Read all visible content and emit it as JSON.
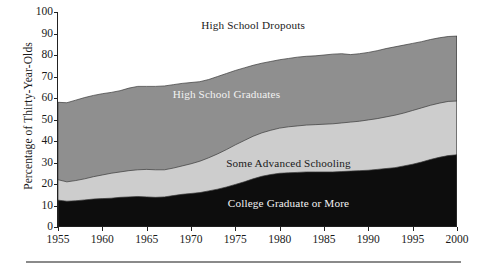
{
  "chart_data": {
    "type": "area",
    "title": "",
    "subtitle": "",
    "xlabel": "",
    "ylabel": "Percentage of Thirty-Year-Olds",
    "xlim": [
      1955,
      2000
    ],
    "ylim": [
      0,
      100
    ],
    "grid": false,
    "legend_position": "inline-area-labels",
    "stacked": true,
    "annotations": [
      {
        "text": "High School Dropouts",
        "x": 1977,
        "y": 94
      },
      {
        "text": "High School Graduates",
        "x": 1974,
        "y": 62
      },
      {
        "text": "Some Advanced Schooling",
        "x": 1981,
        "y": 30
      },
      {
        "text": "College Graduate or More",
        "x": 1981,
        "y": 11
      }
    ],
    "x": [
      1955,
      1956,
      1957,
      1958,
      1959,
      1960,
      1961,
      1962,
      1963,
      1964,
      1965,
      1966,
      1967,
      1968,
      1969,
      1970,
      1971,
      1972,
      1973,
      1974,
      1975,
      1976,
      1977,
      1978,
      1979,
      1980,
      1981,
      1982,
      1983,
      1984,
      1985,
      1986,
      1987,
      1988,
      1989,
      1990,
      1991,
      1992,
      1993,
      1994,
      1995,
      1996,
      1997,
      1998,
      1999,
      2000
    ],
    "xticks": [
      1955,
      1960,
      1965,
      1970,
      1975,
      1980,
      1985,
      1990,
      1995,
      2000
    ],
    "yticks": [
      0,
      10,
      20,
      30,
      40,
      50,
      60,
      70,
      80,
      90,
      100
    ],
    "series": [
      {
        "name": "College Graduate or More",
        "color": "#0d0d0d",
        "label_color": "#f2f2f2",
        "values": [
          12.5,
          12.0,
          12.2,
          12.6,
          13.0,
          13.2,
          13.4,
          13.8,
          14.0,
          14.2,
          14.0,
          13.8,
          14.0,
          14.6,
          15.2,
          15.6,
          16.0,
          16.8,
          17.6,
          18.6,
          19.8,
          21.0,
          22.4,
          23.6,
          24.4,
          25.0,
          25.2,
          25.4,
          25.6,
          25.6,
          25.6,
          25.6,
          25.8,
          26.0,
          26.2,
          26.4,
          26.8,
          27.2,
          27.6,
          28.4,
          29.2,
          30.2,
          31.4,
          32.4,
          33.2,
          33.6
        ]
      },
      {
        "name": "Some Advanced Schooling",
        "color": "#cdcdcd",
        "label_color": "#1a1a1a",
        "values": [
          22.0,
          21.0,
          21.6,
          22.4,
          23.4,
          24.2,
          25.0,
          25.6,
          26.2,
          26.6,
          26.8,
          26.6,
          26.6,
          27.4,
          28.4,
          29.4,
          30.6,
          32.2,
          34.0,
          36.0,
          38.2,
          40.2,
          42.2,
          43.8,
          45.0,
          46.0,
          46.6,
          47.0,
          47.4,
          47.6,
          47.8,
          48.0,
          48.4,
          48.8,
          49.2,
          49.8,
          50.4,
          51.2,
          52.0,
          53.0,
          54.2,
          55.4,
          56.6,
          57.6,
          58.4,
          58.6
        ]
      },
      {
        "name": "High School Graduates",
        "color": "#8f8f8f",
        "label_color": "#f2f2f2",
        "values": [
          58.0,
          57.8,
          59.0,
          60.2,
          61.2,
          62.0,
          62.6,
          63.4,
          64.6,
          65.4,
          65.4,
          65.4,
          65.6,
          66.2,
          66.8,
          67.2,
          67.6,
          68.6,
          70.0,
          71.4,
          72.8,
          74.0,
          75.2,
          76.2,
          77.0,
          77.8,
          78.4,
          79.0,
          79.4,
          79.6,
          80.0,
          80.4,
          80.6,
          80.2,
          80.6,
          81.2,
          82.0,
          83.0,
          83.8,
          84.6,
          85.4,
          86.2,
          87.2,
          88.0,
          88.6,
          88.8
        ]
      },
      {
        "name": "High School Dropouts",
        "color": "#ffffff",
        "label_color": "#1a1a1a",
        "values": [
          100,
          100,
          100,
          100,
          100,
          100,
          100,
          100,
          100,
          100,
          100,
          100,
          100,
          100,
          100,
          100,
          100,
          100,
          100,
          100,
          100,
          100,
          100,
          100,
          100,
          100,
          100,
          100,
          100,
          100,
          100,
          100,
          100,
          100,
          100,
          100,
          100,
          100,
          100,
          100,
          100,
          100,
          100,
          100,
          100,
          100
        ]
      }
    ]
  }
}
